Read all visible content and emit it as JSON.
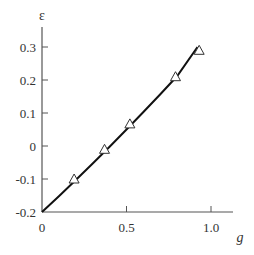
{
  "chart_data": {
    "type": "line",
    "title": "",
    "xlabel": "g",
    "ylabel": "ε",
    "xlim": [
      0,
      1.15
    ],
    "ylim": [
      -0.2,
      0.35
    ],
    "grid": false,
    "legend": null,
    "x_ticks": [
      "0",
      "0.5",
      "1.0"
    ],
    "y_ticks": [
      "-0.2",
      "-0.1",
      "0",
      "0.1",
      "0.2",
      "0.3"
    ],
    "series": [
      {
        "name": "curve",
        "style": "solid-line",
        "color": "#000000",
        "x": [
          0,
          0.1,
          0.2,
          0.3,
          0.4,
          0.5,
          0.6,
          0.7,
          0.8,
          0.92
        ],
        "y": [
          -0.2,
          -0.152,
          -0.103,
          -0.053,
          -0.002,
          0.05,
          0.103,
          0.157,
          0.212,
          0.3
        ]
      },
      {
        "name": "data points",
        "style": "open-triangle-markers",
        "color": "#333333",
        "x": [
          0.19,
          0.37,
          0.52,
          0.79,
          0.93
        ],
        "y": [
          -0.1,
          -0.01,
          0.067,
          0.21,
          0.29
        ]
      }
    ]
  }
}
